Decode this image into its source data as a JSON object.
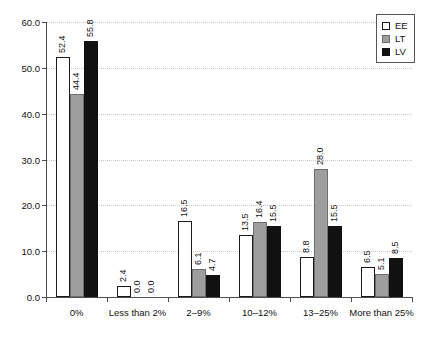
{
  "chart_data": {
    "type": "bar",
    "title": "",
    "subtitle": "",
    "xlabel": "",
    "ylabel": "",
    "ylim": [
      0.0,
      60.0
    ],
    "yticks": [
      "0.0",
      "10.0",
      "20.0",
      "30.0",
      "40.0",
      "50.0",
      "60.0"
    ],
    "ytick_values": [
      0.0,
      10.0,
      20.0,
      30.0,
      40.0,
      50.0,
      60.0
    ],
    "grid": "horizontal-dotted",
    "legend_position": "top-right",
    "categories": [
      "0%",
      "Less than 2%",
      "2–9%",
      "10–12%",
      "13–25%",
      "More than 25%"
    ],
    "series": [
      {
        "name": "EE",
        "color": "#ffffff",
        "edge_color": "#1a1a1a",
        "values": [
          52.4,
          2.4,
          16.5,
          13.5,
          8.8,
          6.5
        ],
        "labels": [
          "52.4",
          "2.4",
          "16.5",
          "13.5",
          "8.8",
          "6.5"
        ]
      },
      {
        "name": "LT",
        "color": "#9e9e9e",
        "edge_color": "#6e6e6e",
        "values": [
          44.4,
          0.0,
          6.1,
          16.4,
          28.0,
          5.1
        ],
        "labels": [
          "44.4",
          "0.0",
          "6.1",
          "16.4",
          "28.0",
          "5.1"
        ]
      },
      {
        "name": "LV",
        "color": "#111111",
        "edge_color": "#111111",
        "values": [
          55.8,
          0.0,
          4.7,
          15.5,
          15.5,
          8.5
        ],
        "labels": [
          "55.8",
          "0.0",
          "4.7",
          "15.5",
          "15.5",
          "8.5"
        ]
      }
    ]
  },
  "legend": {
    "items": [
      {
        "label": "EE",
        "swatch": "white-square-icon"
      },
      {
        "label": "LT",
        "swatch": "gray-square-icon"
      },
      {
        "label": "LV",
        "swatch": "black-square-icon"
      }
    ]
  }
}
